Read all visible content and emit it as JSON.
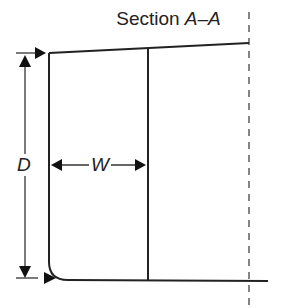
{
  "title": {
    "prefix": "Section",
    "section": "A–A"
  },
  "labels": {
    "depth": "D",
    "width": "W"
  },
  "colors": {
    "line": "#222222",
    "background": "#ffffff"
  }
}
